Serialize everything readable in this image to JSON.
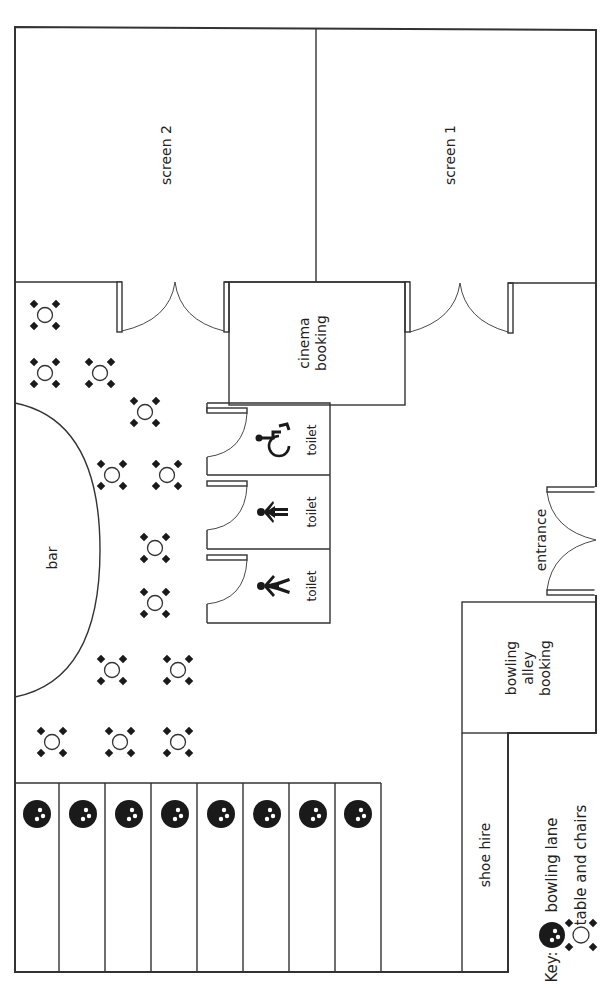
{
  "rooms": {
    "screen2": "screen 2",
    "screen1": "screen 1",
    "cinema_booking": "cinema\nbooking",
    "toilet_accessible": "toilet",
    "toilet_female": "toilet",
    "toilet_male": "toilet",
    "bar": "bar",
    "entrance": "entrance",
    "bowling_alley_booking": "bowling\nalley\nbooking",
    "shoe_hire": "shoe hire"
  },
  "key": {
    "title": "Key:",
    "bowling_lane": "bowling lane",
    "table_and_chairs": "table and chairs"
  },
  "bowling_lanes": {
    "count": 8
  },
  "tables": [
    [
      45,
      315
    ],
    [
      45,
      373
    ],
    [
      100,
      373
    ],
    [
      145,
      412
    ],
    [
      112,
      475
    ],
    [
      167,
      475
    ],
    [
      155,
      548
    ],
    [
      155,
      603
    ],
    [
      112,
      670
    ],
    [
      178,
      670
    ],
    [
      52,
      742
    ],
    [
      120,
      742
    ],
    [
      178,
      742
    ]
  ],
  "colors": {
    "line": "#333333",
    "fill": "#1a1a1a"
  }
}
